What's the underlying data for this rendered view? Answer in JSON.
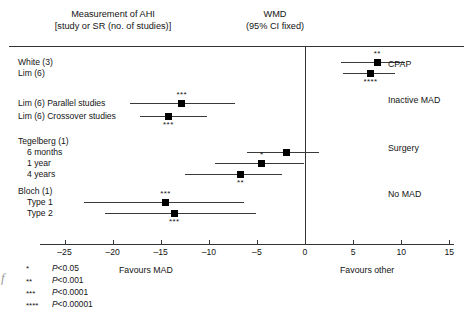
{
  "header": {
    "left_line1": "Measurement of AHI",
    "left_line2": "[study or SR (no. of studies)]",
    "center_line1": "WMD",
    "center_line2": "(95% CI fixed)"
  },
  "axis": {
    "ticks": [
      -25,
      -20,
      -15,
      -10,
      -5,
      0,
      5,
      10,
      15
    ],
    "tick_labels": [
      "–25",
      "–20",
      "–15",
      "–10",
      "–5",
      "0",
      "5",
      "10",
      "15"
    ],
    "favours_left": "Favours MAD",
    "favours_right": "Favours other",
    "null_value": 0
  },
  "group_labels": [
    {
      "label": "CPAP"
    },
    {
      "label": "Inactive MAD"
    },
    {
      "label": "Surgery"
    },
    {
      "label": "No MAD"
    }
  ],
  "footnote": [
    {
      "stars": "*",
      "text": "P<0.05"
    },
    {
      "stars": "**",
      "text": "P<0.001"
    },
    {
      "stars": "***",
      "text": "P<0.0001"
    },
    {
      "stars": "****",
      "text": "P<0.00001"
    }
  ],
  "edge_artifact": "f",
  "colors": {
    "marker": "#000000",
    "line": "#3a3a3a",
    "rule": "#333333",
    "text": "#141414",
    "background": "#ffffff"
  },
  "chart_data": {
    "type": "forest",
    "xlabel": "WMD (95% CI fixed)",
    "ylabel": "",
    "xlim": [
      -27.5,
      15.5
    ],
    "null_line": 0,
    "grid": false,
    "legend_position": "below-left",
    "rows": [
      {
        "label": "White (3)",
        "group": "CPAP",
        "estimate": 7.5,
        "ci_low": 3.7,
        "ci_high": 10.4,
        "significance": "**",
        "star_position": "above",
        "has_data": true
      },
      {
        "label": "Lim (6)",
        "group": "CPAP",
        "estimate": 6.8,
        "ci_low": 3.9,
        "ci_high": 9.4,
        "significance": "****",
        "star_position": "below",
        "has_data": true
      },
      {
        "label": "Lim (6) Parallel studies",
        "group": "Inactive MAD",
        "estimate": -12.8,
        "ci_low": -18.2,
        "ci_high": -7.3,
        "significance": "***",
        "star_position": "above",
        "has_data": true
      },
      {
        "label": "Lim (6) Crossover studies",
        "group": "Inactive MAD",
        "estimate": -14.2,
        "ci_low": -17.2,
        "ci_high": -10.2,
        "significance": "***",
        "star_position": "below",
        "has_data": true
      },
      {
        "label": "Tegelberg (1)",
        "group": "Surgery",
        "has_data": false
      },
      {
        "label": "6 months",
        "group": "Surgery",
        "estimate": -1.9,
        "ci_low": -6.0,
        "ci_high": 1.5,
        "significance": "",
        "star_position": "",
        "has_data": true
      },
      {
        "label": "1 year",
        "group": "Surgery",
        "estimate": -4.5,
        "ci_low": -9.4,
        "ci_high": -0.1,
        "significance": "*",
        "star_position": "above",
        "has_data": true
      },
      {
        "label": "4 years",
        "group": "Surgery",
        "estimate": -6.7,
        "ci_low": -12.5,
        "ci_high": -2.4,
        "significance": "**",
        "star_position": "below",
        "has_data": true
      },
      {
        "label": "Bloch (1)",
        "group": "No MAD",
        "has_data": false
      },
      {
        "label": "Type 1",
        "group": "No MAD",
        "estimate": -14.5,
        "ci_low": -23.0,
        "ci_high": -6.3,
        "significance": "***",
        "star_position": "above",
        "has_data": true
      },
      {
        "label": "Type 2",
        "group": "No MAD",
        "estimate": -13.6,
        "ci_low": -20.8,
        "ci_high": -5.1,
        "significance": "***",
        "star_position": "below",
        "has_data": true
      }
    ]
  }
}
